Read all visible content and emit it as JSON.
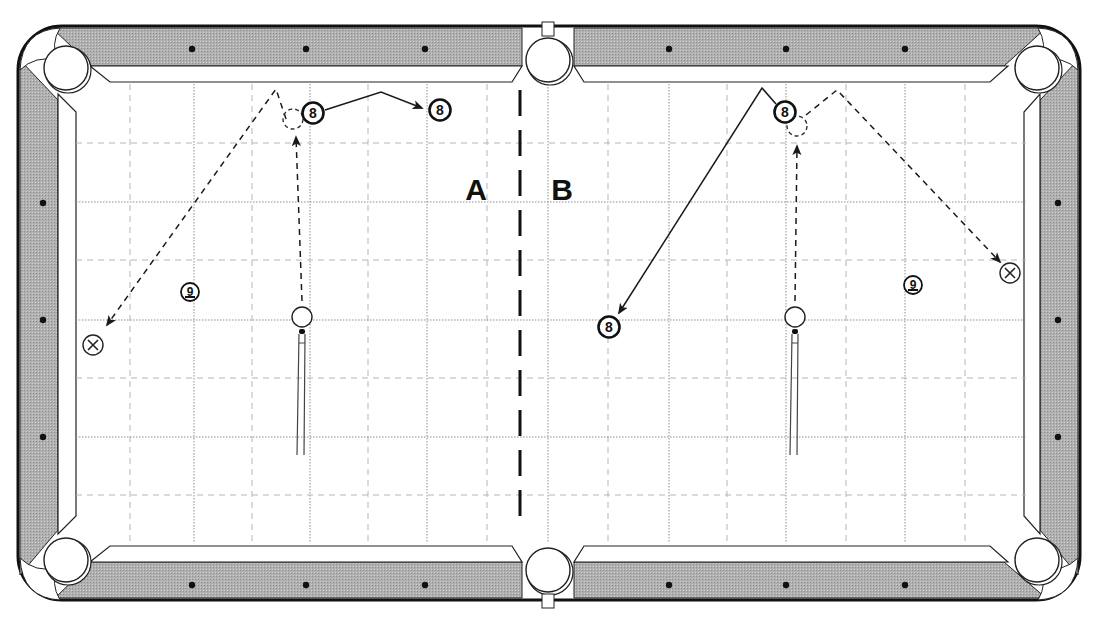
{
  "diagram": {
    "type": "pool-table-shot-diagram",
    "colors": {
      "rail": "#a9a9a9",
      "rail_outline": "#111111",
      "cloth": "#ffffff",
      "grid": "#9a9a9a",
      "ink": "#1a1a1a"
    },
    "regions": [
      {
        "id": "A",
        "label": "A",
        "x": 476,
        "y": 200
      },
      {
        "id": "B",
        "label": "B",
        "x": 562,
        "y": 200
      }
    ],
    "divider": {
      "x": 520,
      "y1": 90,
      "y2": 530,
      "style": "long-dash"
    },
    "diamonds": {
      "top": [
        192,
        306,
        425,
        669,
        786,
        905
      ],
      "bottom": [
        192,
        306,
        425,
        669,
        786,
        905
      ],
      "left": [
        203,
        320,
        437
      ],
      "right": [
        203,
        320,
        437
      ]
    },
    "pockets": [
      {
        "name": "top-left",
        "x": 66,
        "y": 68
      },
      {
        "name": "top-side",
        "x": 548,
        "y": 60
      },
      {
        "name": "top-right",
        "x": 1037,
        "y": 68
      },
      {
        "name": "bottom-left",
        "x": 66,
        "y": 560
      },
      {
        "name": "bottom-side",
        "x": 548,
        "y": 570
      },
      {
        "name": "bottom-right",
        "x": 1037,
        "y": 560
      }
    ],
    "balls": [
      {
        "id": "A-8-start",
        "label": "8",
        "x": 313,
        "y": 113,
        "kind": "object"
      },
      {
        "id": "A-8-end",
        "label": "8",
        "x": 440,
        "y": 110,
        "kind": "object"
      },
      {
        "id": "A-9",
        "label": "9",
        "x": 190,
        "y": 292,
        "kind": "object-small"
      },
      {
        "id": "A-cue",
        "label": "",
        "x": 302,
        "y": 317,
        "kind": "cue"
      },
      {
        "id": "A-x",
        "label": "X",
        "x": 93,
        "y": 345,
        "kind": "target-x"
      },
      {
        "id": "B-8-start",
        "label": "8",
        "x": 785,
        "y": 112,
        "kind": "object"
      },
      {
        "id": "B-8-end",
        "label": "8",
        "x": 609,
        "y": 327,
        "kind": "object"
      },
      {
        "id": "B-9",
        "label": "9",
        "x": 913,
        "y": 285,
        "kind": "object-small"
      },
      {
        "id": "B-cue",
        "label": "",
        "x": 795,
        "y": 317,
        "kind": "cue"
      },
      {
        "id": "B-x",
        "label": "X",
        "x": 1010,
        "y": 273,
        "kind": "target-x"
      }
    ],
    "ghost_balls": [
      {
        "id": "A-ghost",
        "x": 293,
        "y": 119
      },
      {
        "id": "B-ghost",
        "x": 797,
        "y": 126
      }
    ],
    "cue_sticks": [
      {
        "id": "A-stick",
        "x": 302,
        "y_tip": 331,
        "y_end": 455
      },
      {
        "id": "B-stick",
        "x": 795,
        "y_tip": 331,
        "y_end": 455
      }
    ],
    "paths": [
      {
        "id": "A-cue-to-ghost",
        "style": "dashed",
        "points": [
          [
            302,
            301
          ],
          [
            296,
            137
          ]
        ],
        "arrow": true
      },
      {
        "id": "A-cue-deflect",
        "style": "dashed",
        "points": [
          [
            286,
            119
          ],
          [
            276,
            89
          ],
          [
            107,
            325
          ]
        ],
        "arrow": true
      },
      {
        "id": "A-8-travel",
        "style": "solid",
        "points": [
          [
            325,
            110
          ],
          [
            381,
            92
          ],
          [
            422,
            108
          ]
        ],
        "arrow": true
      },
      {
        "id": "B-cue-to-ghost",
        "style": "dashed",
        "points": [
          [
            795,
            301
          ],
          [
            797,
            146
          ]
        ],
        "arrow": true
      },
      {
        "id": "B-cue-deflect",
        "style": "dashed",
        "points": [
          [
            806,
            115
          ],
          [
            837,
            90
          ],
          [
            1000,
            262
          ]
        ],
        "arrow": true
      },
      {
        "id": "B-8-travel",
        "style": "solid",
        "points": [
          [
            776,
            104
          ],
          [
            762,
            88
          ],
          [
            619,
            313
          ]
        ],
        "arrow": true
      }
    ],
    "grid": {
      "major_x": [
        194,
        310,
        427,
        548,
        669,
        786,
        905
      ],
      "minor_x": [
        130,
        252,
        368,
        487,
        608,
        727,
        846,
        965
      ],
      "major_y": [
        202,
        320,
        437
      ],
      "minor_y": [
        143,
        260,
        378,
        495
      ],
      "x_min": 76,
      "x_max": 1026,
      "y_min": 84,
      "y_max": 542
    }
  }
}
